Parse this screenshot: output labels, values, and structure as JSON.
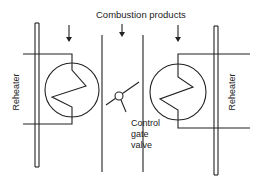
{
  "diagram": {
    "title": "Combustion products",
    "labels": {
      "left_reheater": "Reheater",
      "right_reheater": "Reheater",
      "valve_line1": "Control",
      "valve_line2": "gate",
      "valve_line3": "valve"
    },
    "components": [
      {
        "id": "left-reheater",
        "type": "heat-exchanger-coil"
      },
      {
        "id": "right-reheater",
        "type": "heat-exchanger-coil"
      },
      {
        "id": "control-gate-valve",
        "type": "butterfly-valve"
      },
      {
        "id": "flow-arrows",
        "count": 3,
        "direction": "down"
      }
    ],
    "colors": {
      "line": "#222222",
      "background": "#ffffff"
    }
  }
}
